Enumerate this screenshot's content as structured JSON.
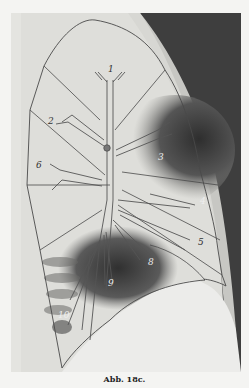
{
  "figure": {
    "caption": "Abb. 18c.",
    "segment_labels": [
      {
        "id": "1",
        "x": 108,
        "y": 72,
        "color": "#333333"
      },
      {
        "id": "2",
        "x": 50,
        "y": 124,
        "color": "#333333"
      },
      {
        "id": "3",
        "x": 160,
        "y": 160,
        "color": "#eeeeee"
      },
      {
        "id": "4",
        "x": 203,
        "y": 204,
        "color": "#eeeeee"
      },
      {
        "id": "5",
        "x": 200,
        "y": 245,
        "color": "#333333"
      },
      {
        "id": "6",
        "x": 38,
        "y": 167,
        "color": "#333333"
      },
      {
        "id": "8",
        "x": 151,
        "y": 265,
        "color": "#eeeeee"
      },
      {
        "id": "9",
        "x": 111,
        "y": 286,
        "color": "#eeeeee"
      },
      {
        "id": "10",
        "x": 62,
        "y": 316,
        "color": "#eeeeee"
      }
    ],
    "colors": {
      "paper": "#f4f4f2",
      "xray_light": "#e2e2de",
      "xray_dark": "#3a3a3a",
      "outline": "#4a4a4a"
    }
  }
}
